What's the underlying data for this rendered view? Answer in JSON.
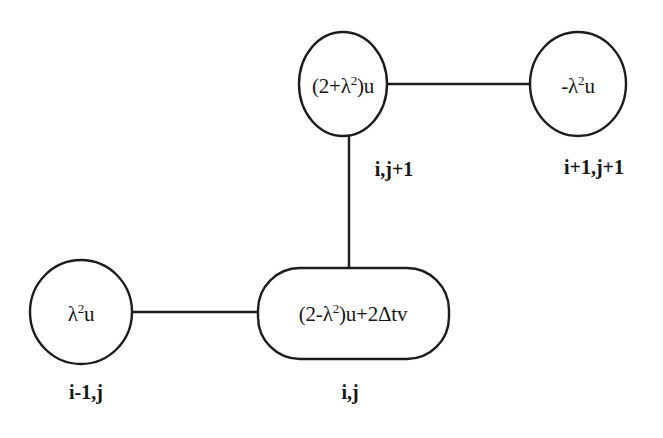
{
  "diagram": {
    "background_color": "#ffffff",
    "stroke_color": "#1c1c1c",
    "nodes": [
      {
        "id": "top-center",
        "shape": "circle",
        "expression": "(2+λ²)u",
        "expr_prefix": "(2+λ",
        "expr_exponent": "2",
        "expr_suffix": ")u",
        "index_label": "i,j+1"
      },
      {
        "id": "top-right",
        "shape": "circle",
        "expression": "-λ²u",
        "expr_prefix": "-λ",
        "expr_exponent": "2",
        "expr_suffix": "u",
        "index_label": "i+1,j+1"
      },
      {
        "id": "center",
        "shape": "rounded-rectangle",
        "expression": "(2-λ²)u+2Δtv",
        "expr_prefix": "(2-λ",
        "expr_exponent": "2",
        "expr_suffix": ")u+2Δtv",
        "index_label": "i,j"
      },
      {
        "id": "left",
        "shape": "circle",
        "expression": "λ²u",
        "expr_prefix": "λ",
        "expr_exponent": "2",
        "expr_suffix": "u",
        "index_label": "i-1,j"
      }
    ],
    "edges": [
      {
        "id": "edge-top-horizontal",
        "from": "top-center",
        "to": "top-right",
        "orientation": "horizontal"
      },
      {
        "id": "edge-vertical",
        "from": "top-center",
        "to": "center",
        "orientation": "vertical"
      },
      {
        "id": "edge-left-horizontal",
        "from": "left",
        "to": "center",
        "orientation": "horizontal"
      }
    ]
  }
}
